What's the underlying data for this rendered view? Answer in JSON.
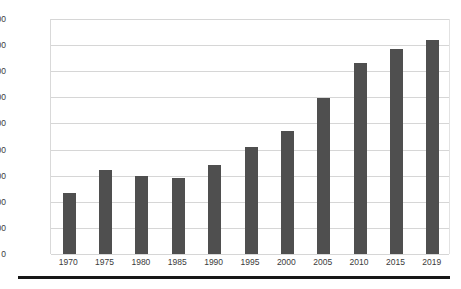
{
  "chart_data": {
    "type": "bar",
    "title": "",
    "subtitle": "",
    "xlabel": "",
    "ylabel": "",
    "categories": [
      "1970",
      "1975",
      "1980",
      "1985",
      "1990",
      "1995",
      "2000",
      "2005",
      "2010",
      "2015",
      "2019"
    ],
    "values": [
      235000,
      320000,
      300000,
      293000,
      340000,
      410000,
      470000,
      598000,
      730000,
      785000,
      818000
    ],
    "series": [
      {
        "name": "",
        "values": [
          235000,
          320000,
          300000,
          293000,
          340000,
          410000,
          470000,
          598000,
          730000,
          785000,
          818000
        ]
      }
    ],
    "ylim": [
      0,
      900000
    ],
    "ytick_values": [
      0,
      100000,
      200000,
      300000,
      400000,
      500000,
      600000,
      700000,
      800000,
      900000
    ],
    "ytick_labels": [
      "0",
      "100,000",
      "200,000",
      "300,000",
      "400,000",
      "500,000",
      "600,000",
      "700,000",
      "800,000",
      "900,000"
    ],
    "grid": true,
    "grid_axis": "y",
    "legend": false,
    "legend_position": "none",
    "bar_color": "#4f4f4f",
    "gridline_color": "#d6d6d6",
    "background_color": "#ffffff",
    "annotations": []
  },
  "figure": {
    "bottom_rule_color": "#171717"
  }
}
